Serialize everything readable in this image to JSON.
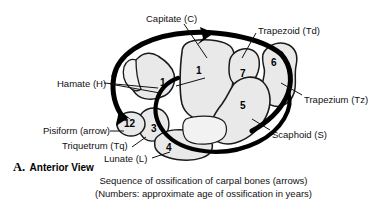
{
  "figure": {
    "panel_letter": "A.",
    "view_title": "Anterior View",
    "caption_line1": "Sequence of ossification of carpal bones (arrows)",
    "caption_line2": "(Numbers: approximate age of ossification in years)",
    "colors": {
      "background": "#ffffff",
      "bone_fill": "#e9e9e9",
      "bone_fill_light": "#f2f2f2",
      "bone_outline": "#1a1a1a",
      "arrow": "#000000",
      "text": "#111111"
    }
  },
  "labels": [
    {
      "id": "capitate",
      "text": "Capitate (C)",
      "x": 146,
      "y": 14
    },
    {
      "id": "trapezoid",
      "text": "Trapezoid (Td)",
      "x": 258,
      "y": 26
    },
    {
      "id": "trapezium",
      "text": "Trapezium (Tz)",
      "x": 304,
      "y": 95
    },
    {
      "id": "scaphoid",
      "text": "Scaphoid (S)",
      "x": 272,
      "y": 130
    },
    {
      "id": "hamate",
      "text": "Hamate (H)",
      "x": 57,
      "y": 79
    },
    {
      "id": "pisiform",
      "text": "Pisiform (arrow)",
      "x": 52,
      "y": 130
    },
    {
      "id": "triquetrum",
      "text": "Triquetrum (Tq)",
      "x": 70,
      "y": 144
    },
    {
      "id": "lunate",
      "text": "Lunate (L)",
      "x": 113,
      "y": 158
    }
  ],
  "bone_numbers": [
    {
      "id": "capitate-age",
      "bone": "Capitate",
      "value": "1",
      "x": 196,
      "y": 66
    },
    {
      "id": "hamate-age",
      "bone": "Hamate",
      "value": "1",
      "x": 160,
      "y": 78
    },
    {
      "id": "trapezoid-age",
      "bone": "Trapezoid",
      "value": "7",
      "x": 240,
      "y": 69
    },
    {
      "id": "trapezium-age",
      "bone": "Trapezium",
      "value": "6",
      "x": 271,
      "y": 58
    },
    {
      "id": "scaphoid-age",
      "bone": "Scaphoid",
      "value": "5",
      "x": 240,
      "y": 101
    },
    {
      "id": "pisiform-age",
      "bone": "Pisiform",
      "value": "12",
      "x": 127,
      "y": 124
    },
    {
      "id": "triquetrum-age",
      "bone": "Triquetrum",
      "value": "3",
      "x": 151,
      "y": 128
    },
    {
      "id": "lunate-age",
      "bone": "Lunate",
      "value": "4",
      "x": 166,
      "y": 147
    }
  ],
  "ossification_sequence": [
    {
      "order": 1,
      "bone": "Capitate",
      "abbr": "C",
      "age_years": 1
    },
    {
      "order": 2,
      "bone": "Hamate",
      "abbr": "H",
      "age_years": 1
    },
    {
      "order": 3,
      "bone": "Triquetrum",
      "abbr": "Tq",
      "age_years": 3
    },
    {
      "order": 4,
      "bone": "Lunate",
      "abbr": "L",
      "age_years": 4
    },
    {
      "order": 5,
      "bone": "Scaphoid",
      "abbr": "S",
      "age_years": 5
    },
    {
      "order": 6,
      "bone": "Trapezium",
      "abbr": "Tz",
      "age_years": 6
    },
    {
      "order": 7,
      "bone": "Trapezoid",
      "abbr": "Td",
      "age_years": 7
    },
    {
      "order": 8,
      "bone": "Pisiform",
      "abbr": "",
      "age_years": 12
    }
  ]
}
